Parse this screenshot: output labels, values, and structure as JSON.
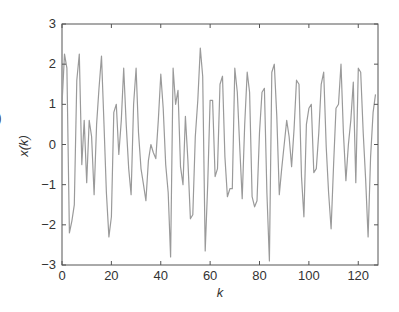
{
  "chart_data": {
    "type": "line",
    "title": "",
    "xlabel": "k",
    "ylabel": "x(k)",
    "xlim": [
      0,
      128
    ],
    "ylim": [
      -3,
      3
    ],
    "grid": false,
    "legend": null,
    "xticks": [
      0,
      20,
      40,
      60,
      80,
      100,
      120
    ],
    "yticks": [
      -3,
      -2,
      -1,
      0,
      1,
      2,
      3
    ],
    "line_color": "#9a9a9a",
    "series": [
      {
        "name": "x(k)",
        "x_start": 0,
        "x_step": 1,
        "values": [
          1.0,
          2.25,
          1.9,
          -2.2,
          -1.9,
          -1.5,
          1.6,
          2.25,
          -0.5,
          0.6,
          -0.95,
          0.6,
          0.2,
          -1.25,
          0.5,
          1.4,
          2.2,
          0.5,
          -1.2,
          -2.3,
          -1.8,
          0.8,
          1.0,
          -0.25,
          0.6,
          1.9,
          0.5,
          -0.6,
          -1.25,
          1.0,
          1.9,
          0.3,
          -0.6,
          -1.0,
          -1.4,
          -0.4,
          0.0,
          -0.2,
          -0.35,
          0.6,
          1.75,
          0.9,
          -0.5,
          -1.2,
          -2.8,
          1.9,
          1.0,
          1.35,
          -0.55,
          -1.0,
          0.7,
          -0.4,
          -1.85,
          -1.75,
          0.2,
          1.1,
          2.4,
          1.7,
          -2.65,
          -1.0,
          1.1,
          1.1,
          -0.8,
          -0.6,
          1.5,
          1.7,
          -0.3,
          -1.3,
          -1.1,
          -1.1,
          1.9,
          1.3,
          -0.1,
          -1.35,
          0.5,
          1.8,
          1.3,
          -1.3,
          -1.55,
          -1.4,
          0.3,
          1.3,
          1.4,
          -1.2,
          -2.9,
          1.8,
          2.0,
          0.7,
          -1.25,
          -0.6,
          0.0,
          0.6,
          0.2,
          -0.55,
          0.4,
          1.6,
          1.5,
          -0.8,
          -1.8,
          0.5,
          0.9,
          1.0,
          -0.7,
          -0.6,
          0.3,
          1.5,
          1.8,
          -0.05,
          -1.2,
          -2.1,
          -0.5,
          0.9,
          1.0,
          2.0,
          0.3,
          -0.9,
          0.0,
          0.6,
          1.55,
          -0.95,
          1.9,
          1.8,
          0.3,
          -0.9,
          -2.3,
          -0.3,
          0.8,
          1.25
        ]
      }
    ]
  },
  "edge_glyph": ")"
}
